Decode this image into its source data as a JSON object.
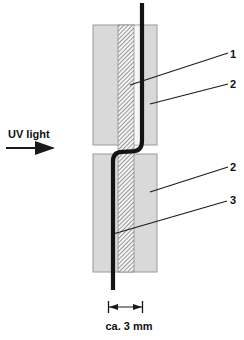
{
  "figure": {
    "type": "technical-diagram",
    "labels": {
      "uv_light": "UV light",
      "callout_1": "1",
      "callout_2_top": "2",
      "callout_2_bottom": "2",
      "callout_3": "3",
      "dimension": "ca. 3 mm"
    },
    "colors": {
      "background": "#ffffff",
      "plate_fill": "#d9d9d9",
      "plate_border": "#9a9a9a",
      "hatch_fill": "#f5f5f5",
      "hatch_line": "#3a3a3a",
      "fiber": "#141414",
      "annotation_line": "#1a1a1a",
      "text": "#111111"
    }
  }
}
